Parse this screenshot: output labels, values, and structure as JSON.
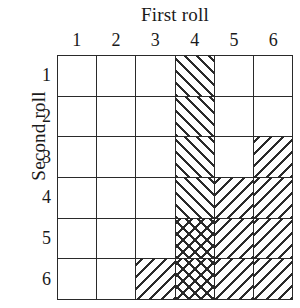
{
  "figure": {
    "column_axis_title": "First roll",
    "row_axis_title": "Second roll",
    "column_labels": [
      "1",
      "2",
      "3",
      "4",
      "5",
      "6"
    ],
    "row_labels": [
      "1",
      "2",
      "3",
      "4",
      "5",
      "6"
    ],
    "colors": {
      "line": "#2a2a2a",
      "background": "#ffffff",
      "hatch": "#2a2a2a"
    }
  },
  "chart_data": {
    "type": "heatmap",
    "title": "",
    "xlabel": "First roll",
    "ylabel": "Second roll",
    "x": [
      "1",
      "2",
      "3",
      "4",
      "5",
      "6"
    ],
    "y": [
      "1",
      "2",
      "3",
      "4",
      "5",
      "6"
    ],
    "grid": true,
    "legend": "none",
    "cell_fill_codes": {
      "none": "unshaded",
      "fwd": "forward-slash hatch",
      "back": "backslash hatch",
      "cross": "cross hatch"
    },
    "rows": [
      {
        "second_roll": "1",
        "cells": [
          "none",
          "none",
          "none",
          "fwd",
          "none",
          "none"
        ]
      },
      {
        "second_roll": "2",
        "cells": [
          "none",
          "none",
          "none",
          "fwd",
          "none",
          "none"
        ]
      },
      {
        "second_roll": "3",
        "cells": [
          "none",
          "none",
          "none",
          "fwd",
          "none",
          "back"
        ]
      },
      {
        "second_roll": "4",
        "cells": [
          "none",
          "none",
          "none",
          "fwd",
          "back",
          "back"
        ]
      },
      {
        "second_roll": "5",
        "cells": [
          "none",
          "none",
          "none",
          "cross",
          "back",
          "back"
        ]
      },
      {
        "second_roll": "6",
        "cells": [
          "none",
          "none",
          "back",
          "cross",
          "back",
          "back"
        ]
      }
    ],
    "values": [
      [
        0,
        0,
        0,
        1,
        0,
        0
      ],
      [
        0,
        0,
        0,
        1,
        0,
        0
      ],
      [
        0,
        0,
        0,
        1,
        0,
        1
      ],
      [
        0,
        0,
        0,
        1,
        1,
        1
      ],
      [
        0,
        0,
        0,
        2,
        1,
        1
      ],
      [
        0,
        0,
        1,
        2,
        1,
        1
      ]
    ],
    "shaded_count": 14,
    "total_count": 36
  }
}
